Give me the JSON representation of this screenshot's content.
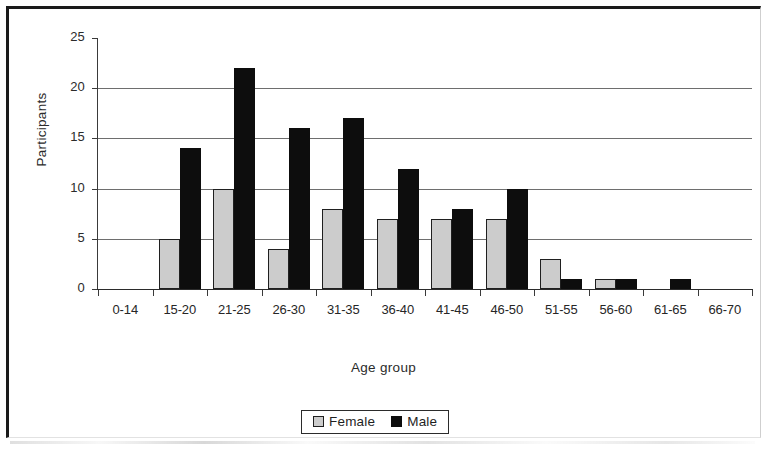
{
  "chart_data": {
    "type": "bar",
    "title": "",
    "subtitle": "",
    "xlabel": "Age group",
    "ylabel": "Participants",
    "categories": [
      "0-14",
      "15-20",
      "21-25",
      "26-30",
      "31-35",
      "36-40",
      "41-45",
      "46-50",
      "51-55",
      "56-60",
      "61-65",
      "66-70"
    ],
    "series": [
      {
        "name": "Female",
        "color": "#cccccc",
        "values": [
          0,
          5,
          10,
          4,
          8,
          7,
          7,
          7,
          3,
          1,
          0,
          0
        ]
      },
      {
        "name": "Male",
        "color": "#0d0d0d",
        "values": [
          0,
          14,
          22,
          16,
          17,
          12,
          8,
          10,
          1,
          1,
          1,
          0
        ]
      }
    ],
    "ylim": [
      0,
      25
    ],
    "yticks": [
      0,
      5,
      10,
      15,
      20,
      25
    ],
    "ytick_labels": [
      "0",
      "5",
      "10",
      "15",
      "20",
      "25"
    ],
    "grid": true,
    "grid_axis": "y",
    "legend_position": "bottom",
    "orientation": "vertical",
    "bar_mode": "grouped"
  },
  "legend": {
    "entries": [
      {
        "label": "Female",
        "swatch": "female-swatch"
      },
      {
        "label": "Male",
        "swatch": "male-swatch"
      }
    ]
  },
  "axes": {
    "y_title": "Participants",
    "x_title": "Age group"
  }
}
